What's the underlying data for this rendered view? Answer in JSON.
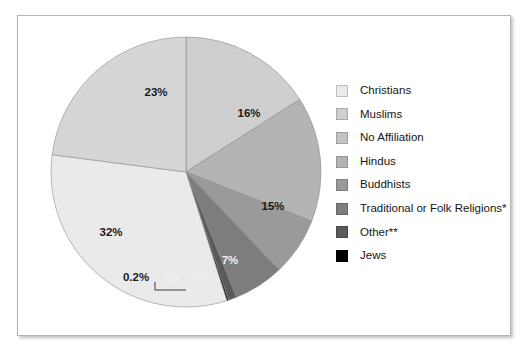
{
  "figure": {
    "background_color": "#ffffff",
    "border_color": "#b4b4b4"
  },
  "chart_data": {
    "type": "pie",
    "title": "",
    "subtitle": "",
    "xlabel": "",
    "ylabel": "",
    "legend_position": "right",
    "grid": false,
    "start_angle_deg": 0,
    "direction": "clockwise",
    "categories": [
      "Christians",
      "Muslims",
      "No Affiliation",
      "Hindus",
      "Buddhists",
      "Traditional or Folk Religions*",
      "Other**",
      "Jews"
    ],
    "values": [
      32,
      16,
      23,
      15,
      7,
      6,
      1,
      0.2
    ],
    "value_labels": [
      "32%",
      "16%",
      "23%",
      "15%",
      "7%",
      "6%",
      "1%",
      "0.2%"
    ],
    "colors": [
      "#eaeaea",
      "#cfcfcf",
      "#d6d6d6",
      "#b4b4b4",
      "#9a9a9a",
      "#7d7d7d",
      "#5a5a5a",
      "#000000"
    ],
    "slices": [
      {
        "label": "Muslims",
        "value": 16,
        "value_label": "16%",
        "color": "#cfcfcf",
        "label_fill": "dark"
      },
      {
        "label": "Hindus",
        "value": 15,
        "value_label": "15%",
        "color": "#b4b4b4",
        "label_fill": "dark"
      },
      {
        "label": "Buddhists",
        "value": 7,
        "value_label": "7%",
        "color": "#9a9a9a",
        "label_fill": "light"
      },
      {
        "label": "Traditional or Folk Religions*",
        "value": 6,
        "value_label": "6%",
        "color": "#7d7d7d",
        "label_fill": "light"
      },
      {
        "label": "Other**",
        "value": 1,
        "value_label": "1%",
        "color": "#5a5a5a",
        "label_fill": "light"
      },
      {
        "label": "Jews",
        "value": 0.2,
        "value_label": "0.2%",
        "color": "#000000",
        "label_fill": "dark"
      },
      {
        "label": "Christians",
        "value": 32,
        "value_label": "32%",
        "color": "#eaeaea",
        "label_fill": "dark"
      },
      {
        "label": "No Affiliation",
        "value": 23,
        "value_label": "23%",
        "color": "#d6d6d6",
        "label_fill": "dark"
      }
    ],
    "annotations": [
      {
        "text": "0.2%",
        "points_to": "Jews",
        "has_leader_line": true
      }
    ]
  },
  "legend": {
    "items": [
      {
        "label": "Christians",
        "color": "#eaeaea"
      },
      {
        "label": "Muslims",
        "color": "#cfcfcf"
      },
      {
        "label": "No Affiliation",
        "color": "#c3c3c3"
      },
      {
        "label": "Hindus",
        "color": "#b4b4b4"
      },
      {
        "label": "Buddhists",
        "color": "#9a9a9a"
      },
      {
        "label": "Traditional or Folk Religions*",
        "color": "#7d7d7d"
      },
      {
        "label": "Other**",
        "color": "#5a5a5a"
      },
      {
        "label": "Jews",
        "color": "#000000"
      }
    ]
  },
  "pie_labels": {
    "p23": "23%",
    "p16": "16%",
    "p15": "15%",
    "p32": "32%",
    "p7": "7%",
    "p6": "6%",
    "p1": "1%",
    "p02": "0.2%"
  }
}
